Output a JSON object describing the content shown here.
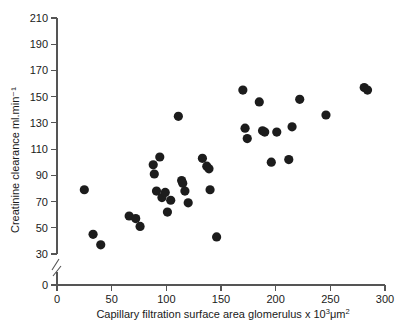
{
  "chart_data": {
    "type": "scatter",
    "title": "",
    "xlabel": "Capillary filtration surface area glomerulus x 10³μm²",
    "ylabel": "Creatinine clearance ml.min⁻¹",
    "xlim": [
      0,
      300
    ],
    "ylim": [
      30,
      210
    ],
    "y_axis_break": true,
    "y_break_below": 30,
    "y_zero_label": "0",
    "grid": false,
    "legend": null,
    "xticks": [
      0,
      50,
      100,
      150,
      200,
      250,
      300
    ],
    "xtick_labels": [
      "0",
      "50",
      "100",
      "150",
      "200",
      "250",
      "300"
    ],
    "yticks": [
      30,
      50,
      70,
      90,
      110,
      130,
      150,
      170,
      190,
      210
    ],
    "ytick_labels": [
      "30",
      "50",
      "70",
      "90",
      "110",
      "130",
      "150",
      "170",
      "190",
      "210"
    ],
    "marker": "filled-circle",
    "marker_color": "#1c1c1c",
    "marker_size": 4.6,
    "points": [
      {
        "x": 25,
        "y": 79
      },
      {
        "x": 33,
        "y": 45
      },
      {
        "x": 40,
        "y": 37
      },
      {
        "x": 66,
        "y": 59
      },
      {
        "x": 72,
        "y": 57
      },
      {
        "x": 76,
        "y": 51
      },
      {
        "x": 88,
        "y": 98
      },
      {
        "x": 89,
        "y": 91
      },
      {
        "x": 91,
        "y": 78
      },
      {
        "x": 94,
        "y": 104
      },
      {
        "x": 96,
        "y": 73
      },
      {
        "x": 99,
        "y": 77
      },
      {
        "x": 101,
        "y": 62
      },
      {
        "x": 104,
        "y": 71
      },
      {
        "x": 111,
        "y": 135
      },
      {
        "x": 114,
        "y": 86
      },
      {
        "x": 115,
        "y": 84
      },
      {
        "x": 117,
        "y": 78
      },
      {
        "x": 120,
        "y": 69
      },
      {
        "x": 133,
        "y": 103
      },
      {
        "x": 137,
        "y": 97
      },
      {
        "x": 139,
        "y": 95
      },
      {
        "x": 140,
        "y": 79
      },
      {
        "x": 146,
        "y": 43
      },
      {
        "x": 170,
        "y": 155
      },
      {
        "x": 172,
        "y": 126
      },
      {
        "x": 174,
        "y": 118
      },
      {
        "x": 185,
        "y": 146
      },
      {
        "x": 188,
        "y": 124
      },
      {
        "x": 190,
        "y": 123
      },
      {
        "x": 196,
        "y": 100
      },
      {
        "x": 201,
        "y": 123
      },
      {
        "x": 212,
        "y": 102
      },
      {
        "x": 215,
        "y": 127
      },
      {
        "x": 222,
        "y": 148
      },
      {
        "x": 246,
        "y": 136
      },
      {
        "x": 281,
        "y": 157
      },
      {
        "x": 284,
        "y": 155
      }
    ]
  }
}
